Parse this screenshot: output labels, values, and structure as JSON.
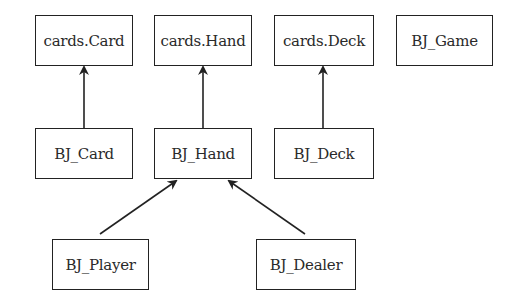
{
  "diagram": {
    "type": "class-inheritance",
    "nodes": [
      {
        "id": "cards_card",
        "label": "cards.Card"
      },
      {
        "id": "cards_hand",
        "label": "cards.Hand"
      },
      {
        "id": "cards_deck",
        "label": "cards.Deck"
      },
      {
        "id": "bj_game",
        "label": "BJ_Game"
      },
      {
        "id": "bj_card",
        "label": "BJ_Card"
      },
      {
        "id": "bj_hand",
        "label": "BJ_Hand"
      },
      {
        "id": "bj_deck",
        "label": "BJ_Deck"
      },
      {
        "id": "bj_player",
        "label": "BJ_Player"
      },
      {
        "id": "bj_dealer",
        "label": "BJ_Dealer"
      }
    ],
    "edges": [
      {
        "from": "BJ_Card",
        "to": "cards.Card"
      },
      {
        "from": "BJ_Hand",
        "to": "cards.Hand"
      },
      {
        "from": "BJ_Deck",
        "to": "cards.Deck"
      },
      {
        "from": "BJ_Player",
        "to": "BJ_Hand"
      },
      {
        "from": "BJ_Dealer",
        "to": "BJ_Hand"
      }
    ],
    "colors": {
      "line": "#222222",
      "text": "#2a2a2a",
      "background": "#ffffff"
    }
  }
}
